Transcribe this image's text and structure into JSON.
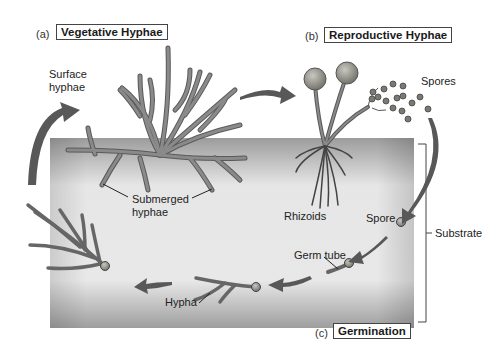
{
  "panels": {
    "a": {
      "letter": "(a)",
      "title": "Vegetative Hyphae"
    },
    "b": {
      "letter": "(b)",
      "title": "Reproductive Hyphae"
    },
    "c": {
      "letter": "(c)",
      "title": "Germination"
    }
  },
  "labels": {
    "surface_hyphae_1": "Surface",
    "surface_hyphae_2": "hyphae",
    "submerged_hyphae_1": "Submerged",
    "submerged_hyphae_2": "hyphae",
    "rhizoids": "Rhizoids",
    "spores": "Spores",
    "spore": "Spore",
    "germ_tube": "Germ tube",
    "hypha": "Hypha",
    "substrate": "Substrate"
  },
  "colors": {
    "substrate_dark": "#9a9a9a",
    "substrate_light": "#f2f2f2",
    "hyphae": "#7d7d7d",
    "hyphae_outline": "#4a4a4a",
    "arrow": "#5a5a5a",
    "sporangium": "#8c8c84"
  }
}
